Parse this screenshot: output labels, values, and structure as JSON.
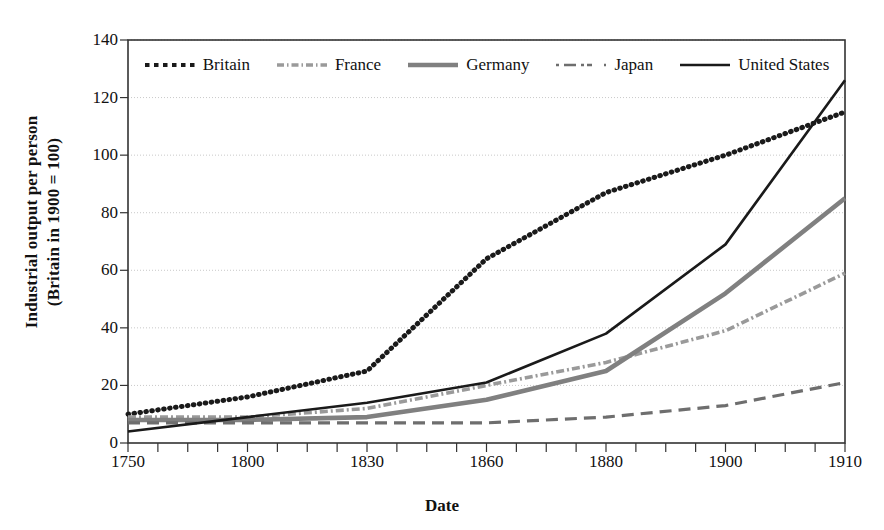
{
  "chart_data": {
    "type": "line",
    "title": "",
    "xlabel": "Date",
    "ylabel": "Industrial output per person (Britain in 1900 = 100)",
    "ylabel_line1": "Industrial output per person",
    "ylabel_line2": "(Britain in 1900 = 100)",
    "categories": [
      "1750",
      "1800",
      "1830",
      "1860",
      "1880",
      "1900",
      "1910"
    ],
    "x": [
      1750,
      1800,
      1830,
      1860,
      1880,
      1900,
      1910
    ],
    "xlim": [
      1750,
      1910
    ],
    "ylim": [
      0,
      140
    ],
    "yticks": [
      0,
      20,
      40,
      60,
      80,
      100,
      120,
      140
    ],
    "xticks": [
      "1750",
      "1800",
      "1830",
      "1860",
      "1880",
      "1900",
      "1910"
    ],
    "grid": true,
    "legend_position": "top-inside",
    "series": [
      {
        "name": "Britain",
        "values": [
          10,
          16,
          25,
          64,
          87,
          100,
          115
        ],
        "style": "dotted",
        "color": "#1a1a1a"
      },
      {
        "name": "France",
        "values": [
          9,
          9,
          12,
          20,
          28,
          39,
          59
        ],
        "style": "dash-dot",
        "color": "#9a9a9a"
      },
      {
        "name": "Germany",
        "values": [
          8,
          8,
          9,
          15,
          25,
          52,
          85
        ],
        "style": "solid-thick",
        "color": "#808080"
      },
      {
        "name": "Japan",
        "values": [
          7,
          7,
          7,
          7,
          9,
          13,
          21
        ],
        "style": "dashed",
        "color": "#6e6e6e"
      },
      {
        "name": "United States",
        "values": [
          4,
          9,
          14,
          21,
          38,
          69,
          126
        ],
        "style": "solid",
        "color": "#1a1a1a"
      }
    ]
  },
  "legend": {
    "items": [
      {
        "label": "Britain",
        "key": "dotted-line-key"
      },
      {
        "label": "France",
        "key": "dash-dot-line-key"
      },
      {
        "label": "Germany",
        "key": "thick-gray-line-key"
      },
      {
        "label": "Japan",
        "key": "dashed-line-key"
      },
      {
        "label": "United States",
        "key": "solid-black-line-key"
      }
    ]
  },
  "colors": {
    "axis": "#333333",
    "grid": "#c9c9c9",
    "britain": "#1a1a1a",
    "france": "#9a9a9a",
    "germany": "#808080",
    "japan": "#6e6e6e",
    "united_states": "#1a1a1a",
    "background": "#ffffff"
  }
}
